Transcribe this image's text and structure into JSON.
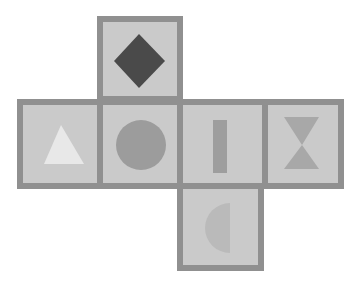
{
  "diagram": {
    "type": "cube-net",
    "colors": {
      "background": "#ffffff",
      "face_fill": "#cacaca",
      "face_border": "#909090"
    },
    "faces": [
      {
        "id": "top",
        "shape": "diamond",
        "color": "#4a4a4a",
        "x": 97,
        "y": 16,
        "w": 86,
        "h": 86
      },
      {
        "id": "left",
        "shape": "triangle",
        "color": "#e8e8e8",
        "x": 17,
        "y": 99,
        "w": 86,
        "h": 90
      },
      {
        "id": "center",
        "shape": "circle",
        "color": "#9c9c9c",
        "x": 97,
        "y": 99,
        "w": 86,
        "h": 90
      },
      {
        "id": "center-right",
        "shape": "vertical-bar",
        "color": "#9e9e9e",
        "x": 177,
        "y": 99,
        "w": 91,
        "h": 90
      },
      {
        "id": "right",
        "shape": "hourglass",
        "color": "#a8a8a8",
        "x": 262,
        "y": 99,
        "w": 82,
        "h": 90
      },
      {
        "id": "bottom",
        "shape": "half-circle",
        "color": "#bababa",
        "x": 177,
        "y": 183,
        "w": 87,
        "h": 88
      }
    ]
  }
}
